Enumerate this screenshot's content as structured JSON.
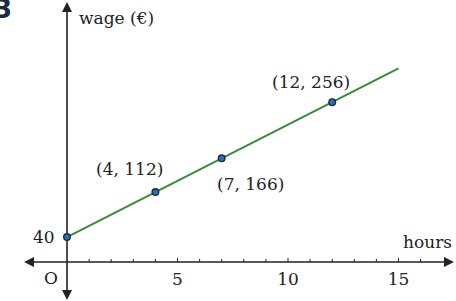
{
  "question_number": "3",
  "chart_data": {
    "type": "line",
    "title": "",
    "xlabel": "hours",
    "ylabel": "wage (€)",
    "xlim": [
      -1.4,
      17.5
    ],
    "ylim": [
      -60,
      410
    ],
    "x_ticks": [
      5,
      10,
      15
    ],
    "x_tick_labels": [
      "5",
      "10",
      "15"
    ],
    "minor_x_ticks": [
      1,
      2,
      3,
      4,
      6,
      7,
      8,
      9,
      11,
      12,
      13,
      14,
      16
    ],
    "origin_label": "O",
    "y_intercept_label": "40",
    "grid": false,
    "legend": null,
    "series": [
      {
        "name": "wage",
        "color": "#3a8a3e",
        "x": [
          0,
          15
        ],
        "y": [
          40,
          310
        ]
      }
    ],
    "points": [
      {
        "x": 0,
        "y": 40,
        "label": "40"
      },
      {
        "x": 4,
        "y": 112,
        "label": "(4, 112)"
      },
      {
        "x": 7,
        "y": 166,
        "label": "(7, 166)"
      },
      {
        "x": 12,
        "y": 256,
        "label": "(12, 256)"
      }
    ],
    "colors": {
      "line": "#3a8a3e",
      "point_fill": "#2e6fa3",
      "point_stroke": "#1c2a44",
      "axis": "#222222"
    }
  }
}
